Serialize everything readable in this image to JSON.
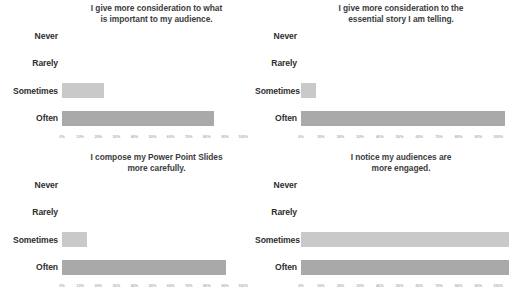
{
  "figure": {
    "background_color": "#ffffff",
    "layout": "2x2-grid",
    "bar_color_often": "#a9a9a9",
    "bar_color_sometimes": "#c9c9c9",
    "tick_color": "#b4b4b4",
    "label_color": "#2e2e2e"
  },
  "axis": {
    "ticks": [
      "0%",
      "10%",
      "20%",
      "30%",
      "40%",
      "50%",
      "60%",
      "70%",
      "80%",
      "90%",
      "100%"
    ],
    "tick_values": [
      0,
      10,
      20,
      30,
      40,
      50,
      60,
      70,
      80,
      90,
      100
    ],
    "min": 0,
    "max": 100
  },
  "categories": [
    "Never",
    "Rarely",
    "Sometimes",
    "Often"
  ],
  "chart_data": [
    {
      "type": "bar",
      "orientation": "horizontal",
      "title": "I give more consideration to what is important to my audience.",
      "title_lines": [
        "I give more consideration to what",
        "is important to my audience."
      ],
      "categories": [
        "Never",
        "Rarely",
        "Sometimes",
        "Often"
      ],
      "values": [
        0,
        0,
        22,
        79
      ],
      "xlabel": "",
      "ylabel": "",
      "xlim": [
        0,
        100
      ],
      "grid": false,
      "legend": "none"
    },
    {
      "type": "bar",
      "orientation": "horizontal",
      "title": "I give more consideration to the essential story I am telling.",
      "title_lines": [
        "I give more consideration to the",
        "essential story I am telling."
      ],
      "categories": [
        "Never",
        "Rarely",
        "Sometimes",
        "Often"
      ],
      "values": [
        0,
        0,
        7,
        97
      ],
      "xlabel": "",
      "ylabel": "",
      "xlim": [
        0,
        100
      ],
      "grid": false,
      "legend": "none"
    },
    {
      "type": "bar",
      "orientation": "horizontal",
      "title": "I compose my Power Point Slides more carefully.",
      "title_lines": [
        "I compose my Power Point Slides",
        "more carefully."
      ],
      "categories": [
        "Never",
        "Rarely",
        "Sometimes",
        "Often"
      ],
      "values": [
        0,
        0,
        13,
        85
      ],
      "xlabel": "",
      "ylabel": "",
      "xlim": [
        0,
        100
      ],
      "grid": false,
      "legend": "none"
    },
    {
      "type": "bar",
      "orientation": "horizontal",
      "title": "I notice my audiences are more engaged.",
      "title_lines": [
        "I notice my audiences are",
        "more engaged."
      ],
      "categories": [
        "Never",
        "Rarely",
        "Sometimes",
        "Often"
      ],
      "values": [
        0,
        0,
        99,
        99
      ],
      "xlabel": "",
      "ylabel": "",
      "xlim": [
        0,
        100
      ],
      "grid": false,
      "legend": "none"
    }
  ]
}
